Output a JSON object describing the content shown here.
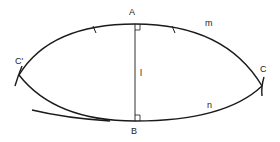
{
  "diagram": {
    "type": "geometric-construction",
    "stroke_color": "#1a1a1a",
    "labels": {
      "A": "A",
      "B": "B",
      "C": "C",
      "C_prime": "C'",
      "m": "m",
      "n": "n",
      "l": "l"
    },
    "elements": [
      {
        "name": "arc-m",
        "from": "C'",
        "to": "C",
        "through": "A",
        "label": "m"
      },
      {
        "name": "arc-n",
        "from": "C'",
        "to": "C",
        "through": "B",
        "label": "n"
      },
      {
        "name": "segment-AB",
        "from": "A",
        "to": "B",
        "label": "l"
      },
      {
        "name": "right-angle-A",
        "at": "A"
      },
      {
        "name": "right-angle-B",
        "at": "B"
      },
      {
        "name": "equal-length-ticks",
        "on": "arc-m",
        "count": 2
      },
      {
        "name": "tangent-arc",
        "through": "B"
      }
    ]
  }
}
